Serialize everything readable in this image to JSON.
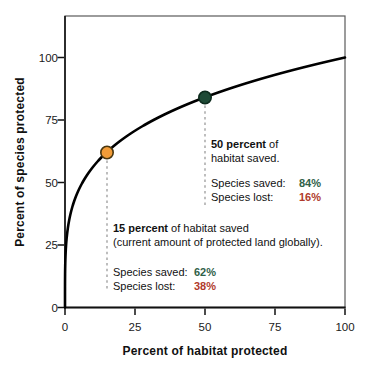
{
  "figure": {
    "background": "#ffffff"
  },
  "chart_data": {
    "type": "line",
    "title": "",
    "xlabel": "Percent of habitat protected",
    "ylabel": "Percent of species protected",
    "x_ticks": [
      0,
      25,
      50,
      75,
      100
    ],
    "y_ticks": [
      0,
      25,
      50,
      75,
      100
    ],
    "xlim": [
      0,
      100
    ],
    "ylim": [
      0,
      116
    ],
    "grid": false,
    "legend": "none",
    "line_color": "#000000",
    "curve": {
      "model": "power",
      "formula": "y = 100*(x/100)^0.25",
      "exponent": 0.25
    },
    "points": [
      {
        "name": "current-protection-point",
        "x": 15,
        "y": 62,
        "fill": "#F29C38",
        "stroke": "#4A3710",
        "dash_to_y": 6.6
      },
      {
        "name": "half-habitat-point",
        "x": 50,
        "y": 84,
        "fill": "#1E4A36",
        "stroke": "#0D2B1D",
        "dash_to_y": 40.6
      }
    ]
  },
  "annotations": {
    "fifty": {
      "line1_bold": "50 percent",
      "line1_rest": " of",
      "line2": "habitat saved.",
      "saved_label": "Species saved:",
      "saved_value": "84%",
      "lost_label": "Species lost:",
      "lost_value": "16%"
    },
    "fifteen": {
      "line1_bold": "15 percent",
      "line1_rest": " of habitat saved",
      "line2": "(current amount of protected land globally).",
      "saved_label": "Species saved:",
      "saved_value": "62%",
      "lost_label": "Species lost:",
      "lost_value": "38%"
    }
  },
  "colors": {
    "saved_green": "#2F6148",
    "lost_red": "#B03A2B",
    "dashed_gray": "#9B9B9B",
    "frame_gray": "#5A5A5A",
    "axis_black": "#111111"
  }
}
